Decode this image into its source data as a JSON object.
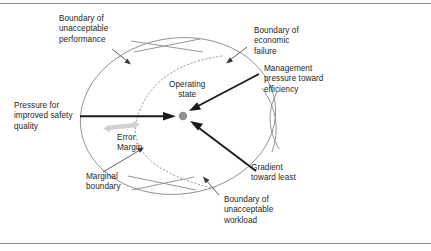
{
  "figure": {
    "colors": {
      "boundary_stroke": "#8a8a8a",
      "dotted_stroke": "#9a9a9a",
      "bold_arrow": "#1a1a1a",
      "error_margin_arrow": "#cfcfcf",
      "operating_point": "#8f8f8f",
      "text": "#231f20",
      "frame": "#8d8d8d"
    },
    "labels": {
      "unacceptable_performance": "Boundary of\nunacceptable\nperformance",
      "economic_failure": "Boundary of\neconomic\nfailure",
      "management_pressure": "Management\npressure toward\nefficiency",
      "operating_state": "Operating\nstate",
      "pressure_safety": "Pressure for\nimproved safety\nquality",
      "error_margin": "Error\nMargin",
      "marginal_boundary": "Marginal\nboundary",
      "gradient_least": "Gradient\ntoward least",
      "unacceptable_workload": "Boundary of\nunacceptable\nworkload"
    },
    "shapes": {
      "operating_point_label": "operating-state-dot",
      "outer_boundary_label": "acceptable-performance-envelope",
      "inner_boundary_label": "marginal-boundary-dotted-curve"
    }
  }
}
